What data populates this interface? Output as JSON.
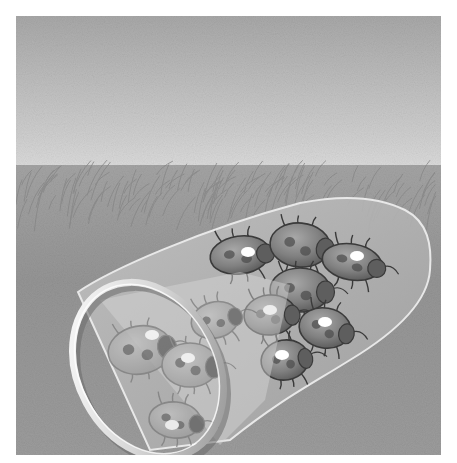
{
  "illustration": {
    "subject": "insect collecting net full of beetles lying in grass",
    "style": "greyscale illustration",
    "frame": {
      "x": 16,
      "y": 16,
      "width": 425,
      "height": 439
    },
    "colors": {
      "sky_top": "#a9a9a9",
      "sky_horizon": "#d9d9d9",
      "grass": "#9a9a9a",
      "grass_dark": "#7d7d7d",
      "net_fill": "#b4b4b4",
      "net_edge": "#e6e6e6",
      "ring": "#f2f2f2",
      "ring_shadow": "#6e6e6e",
      "beetle_body": "#8a8a8a",
      "beetle_outline": "#3a3a3a",
      "highlight": "#ffffff"
    },
    "beetles": [
      {
        "cx": 240,
        "cy": 255,
        "rx": 30,
        "ry": 19,
        "rot": -8,
        "spot": [
          248,
          252
        ]
      },
      {
        "cx": 300,
        "cy": 245,
        "rx": 30,
        "ry": 22,
        "rot": 5,
        "spot": null
      },
      {
        "cx": 352,
        "cy": 262,
        "rx": 30,
        "ry": 18,
        "rot": 10,
        "spot": [
          357,
          256
        ]
      },
      {
        "cx": 300,
        "cy": 290,
        "rx": 30,
        "ry": 22,
        "rot": 0,
        "spot": null
      },
      {
        "cx": 270,
        "cy": 315,
        "rx": 26,
        "ry": 20,
        "rot": -5,
        "spot": [
          270,
          310
        ]
      },
      {
        "cx": 325,
        "cy": 328,
        "rx": 26,
        "ry": 20,
        "rot": 10,
        "spot": [
          325,
          322
        ]
      },
      {
        "cx": 285,
        "cy": 360,
        "rx": 24,
        "ry": 20,
        "rot": -10,
        "spot": [
          282,
          355
        ]
      }
    ],
    "inner_beetles": [
      {
        "cx": 140,
        "cy": 350,
        "rx": 32,
        "ry": 24,
        "rot": -10,
        "spot": [
          152,
          335
        ]
      },
      {
        "cx": 190,
        "cy": 365,
        "rx": 28,
        "ry": 22,
        "rot": 0,
        "spot": [
          188,
          358
        ]
      },
      {
        "cx": 175,
        "cy": 420,
        "rx": 26,
        "ry": 18,
        "rot": 5,
        "spot": [
          172,
          425
        ]
      },
      {
        "cx": 215,
        "cy": 320,
        "rx": 24,
        "ry": 18,
        "rot": -15,
        "spot": null
      }
    ]
  }
}
